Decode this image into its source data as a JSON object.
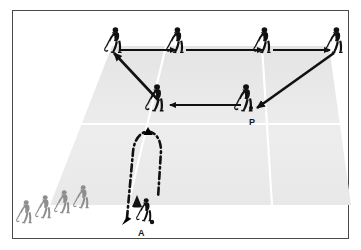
{
  "diagram": {
    "type": "sports-drill-diagram",
    "labels": [
      {
        "id": "P",
        "text": "P",
        "x": 249,
        "y": 118,
        "meaning": "passer-player"
      },
      {
        "id": "A",
        "text": "A",
        "x": 138,
        "y": 229,
        "meaning": "attacker-player"
      }
    ],
    "colors": {
      "border": "#4a4a4a",
      "pitch_fill": "#ececec",
      "pitch_line": "#ffffff",
      "player_dark": "#111111",
      "player_grey": "#8e8e8e",
      "arrow": "#111111",
      "background": "#ffffff",
      "label_text": "#1a1a1a"
    },
    "pitch": {
      "shape": "trapezoid-perspective",
      "points": "112,46 329,46 351,205 50,205",
      "lines": [
        {
          "name": "pitch-line-left-diagonal",
          "x1": 166,
          "y1": 46,
          "x2": 128,
          "y2": 205
        },
        {
          "name": "pitch-line-right-diagonal",
          "x1": 262,
          "y1": 46,
          "x2": 272,
          "y2": 205
        },
        {
          "name": "pitch-line-horizontal",
          "x1": 62,
          "y1": 124,
          "x2": 348,
          "y2": 124
        }
      ]
    },
    "players": [
      {
        "name": "player-top-1",
        "x": 113,
        "y": 27,
        "tone": "dark",
        "flip": false
      },
      {
        "name": "player-top-2",
        "x": 176,
        "y": 27,
        "tone": "dark",
        "flip": false
      },
      {
        "name": "player-top-3",
        "x": 263,
        "y": 27,
        "tone": "dark",
        "flip": false
      },
      {
        "name": "player-top-4",
        "x": 335,
        "y": 27,
        "tone": "dark",
        "flip": false
      },
      {
        "name": "player-middle-receiver",
        "x": 155,
        "y": 99,
        "tone": "dark",
        "flip": false
      },
      {
        "name": "player-passer-P",
        "x": 244,
        "y": 99,
        "tone": "dark",
        "flip": false
      },
      {
        "name": "player-attacker-A",
        "x": 146,
        "y": 210,
        "tone": "dark",
        "flip": false
      },
      {
        "name": "queue-player-1",
        "x": 23,
        "y": 211,
        "tone": "grey",
        "flip": false
      },
      {
        "name": "queue-player-2",
        "x": 42,
        "y": 206,
        "tone": "grey",
        "flip": false
      },
      {
        "name": "queue-player-3",
        "x": 60,
        "y": 201,
        "tone": "grey",
        "flip": false
      },
      {
        "name": "queue-player-4",
        "x": 79,
        "y": 196,
        "tone": "grey",
        "flip": false
      }
    ],
    "arrows": [
      {
        "name": "arrow-pass-1-right",
        "x1": 120,
        "y1": 50,
        "x2": 178,
        "y2": 50,
        "style": "solid"
      },
      {
        "name": "arrow-pass-2-right",
        "x1": 186,
        "y1": 50,
        "x2": 265,
        "y2": 50,
        "style": "solid"
      },
      {
        "name": "arrow-pass-3-right",
        "x1": 273,
        "y1": 50,
        "x2": 331,
        "y2": 50,
        "style": "solid"
      },
      {
        "name": "arrow-diagonal-up-left",
        "x1": 158,
        "y1": 100,
        "x2": 113,
        "y2": 52,
        "style": "solid"
      },
      {
        "name": "arrow-pass-left-horizontal",
        "x1": 240,
        "y1": 105,
        "x2": 168,
        "y2": 105,
        "style": "solid"
      },
      {
        "name": "arrow-diagonal-down-left",
        "x1": 335,
        "y1": 52,
        "x2": 256,
        "y2": 108,
        "style": "solid"
      }
    ],
    "run_path": {
      "name": "run-loop-dash-dot",
      "style": "dash-dot",
      "description": "Player A runs up the pitch, loops around at the top and returns down-left",
      "arrow_up_x": 148,
      "arrow_up_y": 130,
      "arrow_down_x": 124,
      "arrow_down_y": 221
    },
    "cone": {
      "name": "training-cone",
      "x": 137,
      "y": 198
    }
  }
}
